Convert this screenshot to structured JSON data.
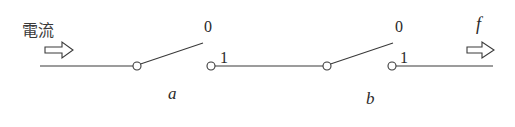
{
  "diagram": {
    "input_label": "電流",
    "output_label": "f",
    "switches": [
      {
        "name": "a",
        "state_top_label": "0",
        "state_bottom_label": "1"
      },
      {
        "name": "b",
        "state_top_label": "0",
        "state_bottom_label": "1"
      }
    ],
    "colors": {
      "stroke": "#3a3a3a",
      "background": "#ffffff"
    }
  }
}
